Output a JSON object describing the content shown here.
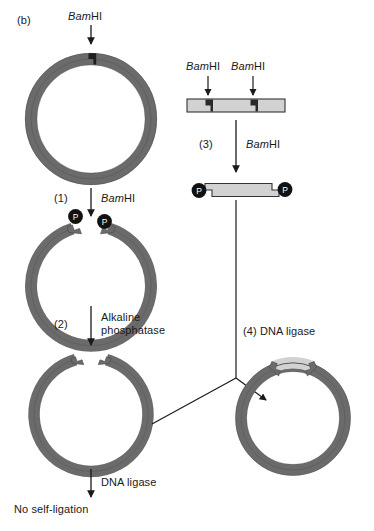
{
  "figure": {
    "panel_label": "(b)",
    "title_implied": "Alkaline phosphatase treatment prevents vector self-ligation",
    "colors": {
      "vector_dna": "#6b6b6b",
      "vector_dna_edge": "#4a4a4a",
      "insert_dna_fill": "#d2d2d2",
      "insert_dna_edge": "#333333",
      "phosphate_circle": "#111111",
      "arrow": "#1a1a1a",
      "background": "#ffffff",
      "text": "#1a1a1a"
    }
  },
  "enzymes": {
    "bamhi_prefix_italic": "Bam",
    "bamhi_suffix": "HI",
    "alkaline_phosphatase_line1": "Alkaline",
    "alkaline_phosphatase_line2": "phosphatase",
    "dna_ligase": "DNA ligase"
  },
  "steps": {
    "step1_number": "(1)",
    "step1_enzyme_italic": "Bam",
    "step1_enzyme_rest": "HI",
    "step2_number": "(2)",
    "step3_number": "(3)",
    "step3_enzyme_italic": "Bam",
    "step3_enzyme_rest": "HI",
    "step4_label": "(4) DNA ligase"
  },
  "left_pathway": {
    "vector_uncut_name": "circular plasmid vector",
    "vector_cut_name": "linearized vector with 5' phosphates",
    "vector_dephosphorylated_name": "dephosphorylated linear vector",
    "final_enzyme": "DNA ligase",
    "outcome": "No self-ligation"
  },
  "right_pathway": {
    "fragment_uncut_name": "linear DNA with two BamHI sites",
    "site_label_left": "BamHI",
    "site_label_right": "BamHI",
    "fragment_cut_name": "excised insert with 5' phosphates",
    "phosphate_symbol": "P",
    "product_name": "recombinant plasmid"
  },
  "phosphate_markers": {
    "symbol": "P",
    "vector_left": "P",
    "vector_right": "P",
    "insert_left": "P",
    "insert_right": "P"
  }
}
